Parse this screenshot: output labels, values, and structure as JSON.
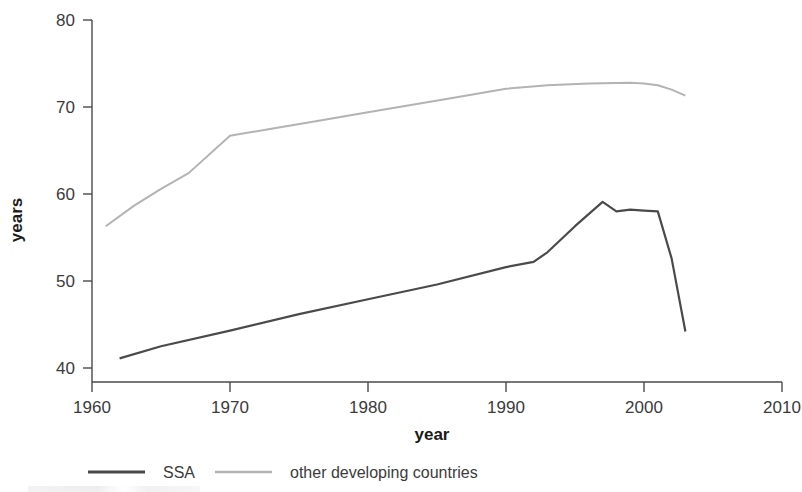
{
  "chart_data": {
    "type": "line",
    "title": "",
    "xlabel": "year",
    "ylabel": "years",
    "xlim": [
      1960,
      2010
    ],
    "ylim": [
      40,
      80
    ],
    "xticks": [
      1960,
      1970,
      1980,
      1990,
      2000,
      2010
    ],
    "yticks": [
      40,
      50,
      60,
      70,
      80
    ],
    "xtick_labels": [
      "1960",
      "1970",
      "1980",
      "1990",
      "2000",
      "2010"
    ],
    "ytick_labels": [
      "40",
      "50",
      "60",
      "70",
      "80"
    ],
    "grid": false,
    "legend_position": "bottom-left",
    "series": [
      {
        "name": "SSA",
        "color": "#4a4a4a",
        "x": [
          1962,
          1965,
          1970,
          1975,
          1980,
          1985,
          1990,
          1992,
          1993,
          1995,
          1997,
          1998,
          1999,
          2000,
          2001,
          2002,
          2003
        ],
        "values": [
          41.1,
          42.5,
          44.3,
          46.2,
          47.9,
          49.6,
          51.6,
          52.2,
          53.3,
          56.3,
          59.1,
          58.0,
          58.2,
          58.1,
          58.0,
          52.6,
          44.2
        ]
      },
      {
        "name": "other developing countries",
        "color": "#b3b3b3",
        "x": [
          1961,
          1963,
          1965,
          1967,
          1970,
          1973,
          1976,
          1980,
          1983,
          1986,
          1990,
          1993,
          1996,
          1999,
          2000,
          2001,
          2002,
          2003
        ],
        "values": [
          56.3,
          58.6,
          60.6,
          62.4,
          66.7,
          67.5,
          68.3,
          69.4,
          70.2,
          71.0,
          72.1,
          72.5,
          72.7,
          72.8,
          72.7,
          72.5,
          72.0,
          71.3
        ]
      }
    ]
  },
  "legend": {
    "entries": [
      {
        "label": "SSA",
        "color": "#4a4a4a"
      },
      {
        "label": "other developing countries",
        "color": "#b3b3b3"
      }
    ]
  },
  "axes": {
    "x_title": "year",
    "y_title": "years"
  }
}
